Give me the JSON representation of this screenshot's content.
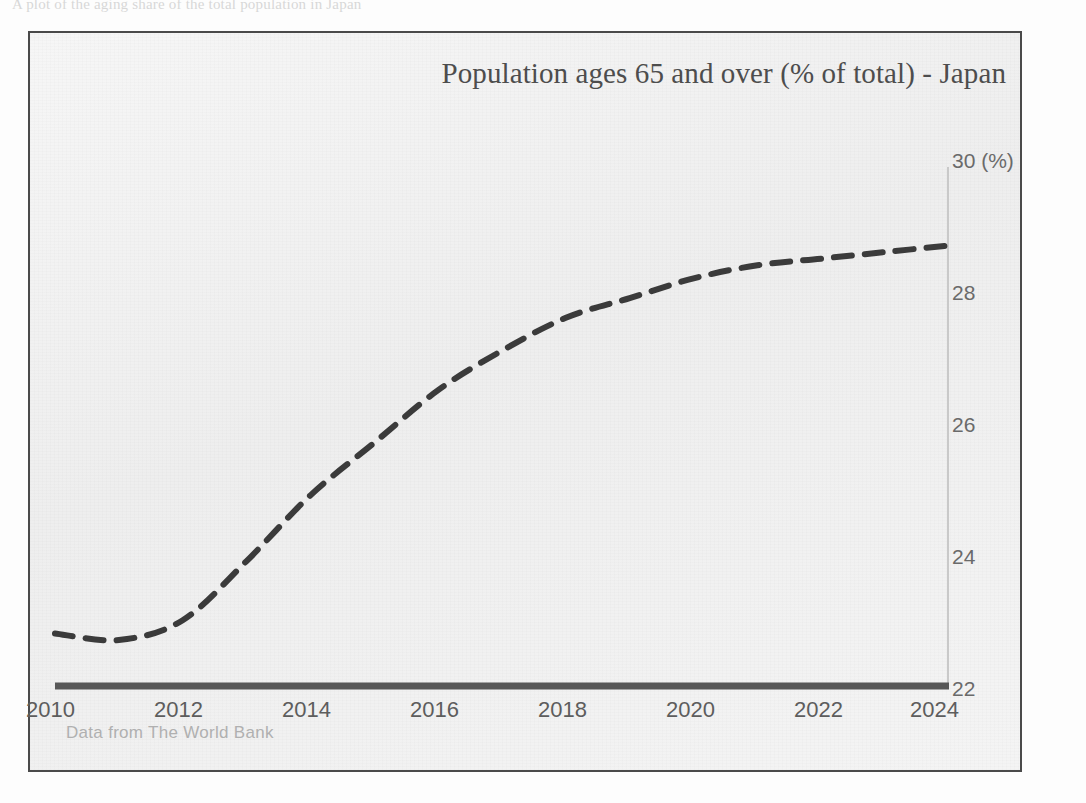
{
  "page": {
    "top_bleed_text": "A plot of the aging share of the total population in Japan"
  },
  "chart": {
    "title": "Population ages 65 and over (% of total) - Japan",
    "source_note": "Data from The World Bank",
    "y_axis_unit_label": "30 (%)",
    "colors": {
      "background": "#f2f2f2",
      "frame_border": "#4a4a4a",
      "line": "#3b3b3b",
      "x_axis_bar": "#585858",
      "y_axis_line": "#c9c9c9",
      "tick_text": "#6a6a6a",
      "title_text": "#4d4d4d",
      "source_text": "#b0b0b0"
    }
  },
  "chart_data": {
    "type": "line",
    "title": "Population ages 65 and over (% of total) - Japan",
    "subtitle": "",
    "xlabel": "",
    "ylabel": "(%)",
    "xlim": [
      2010,
      2024
    ],
    "ylim": [
      22,
      30
    ],
    "grid": false,
    "legend": false,
    "line_style": "dashed",
    "x_tick_labels": [
      "2010",
      "2012",
      "2014",
      "2016",
      "2018",
      "2020",
      "2022",
      "2024"
    ],
    "x_ticks": [
      2010,
      2012,
      2014,
      2016,
      2018,
      2020,
      2022,
      2024
    ],
    "y_tick_labels": [
      "22",
      "24",
      "26",
      "28",
      "30 (%)"
    ],
    "y_ticks": [
      22,
      24,
      26,
      28,
      30
    ],
    "annotations": [
      "Data from The World Bank"
    ],
    "series": [
      {
        "name": "Population ages 65 and over (% of total) - Japan",
        "x": [
          2010,
          2011,
          2012,
          2013,
          2014,
          2015,
          2016,
          2017,
          2018,
          2019,
          2020,
          2021,
          2022,
          2023,
          2024
        ],
        "values": [
          22.8,
          22.7,
          23.0,
          23.9,
          24.9,
          25.7,
          26.5,
          27.1,
          27.6,
          27.9,
          28.2,
          28.4,
          28.5,
          28.6,
          28.7
        ]
      }
    ]
  }
}
